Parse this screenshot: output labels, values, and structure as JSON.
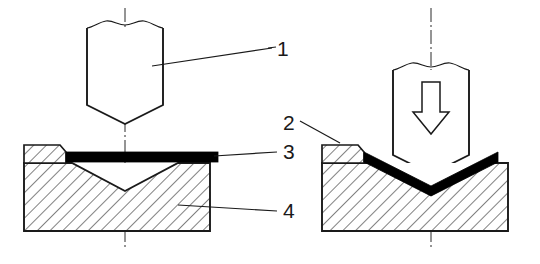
{
  "figure": {
    "background_color": "#ffffff",
    "line_color": "#1a1a1a",
    "hatch_color": "#1a1a1a",
    "sheet_color": "#000000"
  },
  "callouts": [
    {
      "id": "1",
      "label": "1",
      "refers_to": "punch",
      "x": 277,
      "y": 40
    },
    {
      "id": "2",
      "label": "2",
      "refers_to": "back-stop-block",
      "x": 283,
      "y": 114
    },
    {
      "id": "3",
      "label": "3",
      "refers_to": "sheet-metal-blank",
      "x": 283,
      "y": 143
    },
    {
      "id": "4",
      "label": "4",
      "refers_to": "v-die",
      "x": 283,
      "y": 202
    }
  ],
  "stages": [
    {
      "name": "before-bending",
      "side": "left",
      "parts": [
        "punch",
        "sheet-metal-blank",
        "v-die",
        "back-stop-block",
        "centre-line"
      ]
    },
    {
      "name": "during-bending",
      "side": "right",
      "parts": [
        "punch",
        "force-arrow",
        "bent-sheet-metal",
        "v-die",
        "back-stop-block",
        "centre-line"
      ]
    }
  ],
  "symbols": {
    "force_arrow": "downward-hollow-arrow",
    "centre_line": "dash-dot",
    "break_line": "wavy-break",
    "section_fill": "45-degree-hatching"
  }
}
